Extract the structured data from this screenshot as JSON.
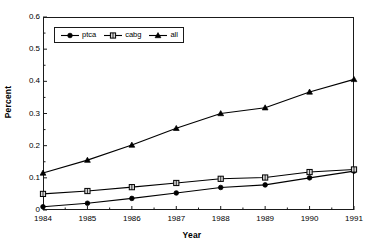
{
  "chart_data": {
    "type": "line",
    "title": "",
    "xlabel": "Year",
    "ylabel": "Percent",
    "x": [
      1984,
      1985,
      1986,
      1987,
      1988,
      1989,
      1990,
      1991
    ],
    "categories": [
      "1984",
      "1985",
      "1986",
      "1987",
      "1988",
      "1989",
      "1990",
      "1991"
    ],
    "xlim": [
      1984,
      1991
    ],
    "ylim": [
      0,
      0.6
    ],
    "ytick_labels": [
      "0",
      "0.1",
      "0.2",
      "0.3",
      "0.4",
      "0.5",
      "0.6"
    ],
    "ytick_values": [
      0,
      0.1,
      0.2,
      0.3,
      0.4,
      0.5,
      0.6
    ],
    "xtick_labels": [
      "1984",
      "1985",
      "1986",
      "1987",
      "1988",
      "1989",
      "1990",
      "1991"
    ],
    "minor_xticks": true,
    "minor_yticks": true,
    "grid": false,
    "legend_position": "upper-left-inside",
    "series": [
      {
        "name": "ptca",
        "marker": "circle",
        "color": "#000000",
        "values": [
          0.01,
          0.021,
          0.036,
          0.053,
          0.07,
          0.078,
          0.1,
          0.121
        ]
      },
      {
        "name": "cabg",
        "marker": "square",
        "color": "#000000",
        "values": [
          0.05,
          0.059,
          0.071,
          0.084,
          0.097,
          0.101,
          0.118,
          0.126
        ]
      },
      {
        "name": "all",
        "marker": "triangle",
        "color": "#000000",
        "values": [
          0.115,
          0.155,
          0.202,
          0.254,
          0.3,
          0.318,
          0.367,
          0.406
        ]
      }
    ]
  },
  "legend": {
    "items": [
      {
        "label": "ptca",
        "marker": "circle"
      },
      {
        "label": "cabg",
        "marker": "square"
      },
      {
        "label": "all",
        "marker": "triangle"
      }
    ]
  },
  "axes": {
    "x_title": "Year",
    "y_title": "Percent"
  },
  "colors": {
    "line": "#1a1a1a",
    "axis": "#1a1a1a",
    "background": "#ffffff",
    "marker_fill_open": "#d8d8d8"
  }
}
